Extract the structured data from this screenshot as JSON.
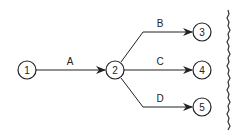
{
  "diagram": {
    "type": "activity-on-arrow network",
    "nodes": [
      {
        "id": "1",
        "label": "1"
      },
      {
        "id": "2",
        "label": "2"
      },
      {
        "id": "3",
        "label": "3"
      },
      {
        "id": "4",
        "label": "4"
      },
      {
        "id": "5",
        "label": "5"
      }
    ],
    "edges": [
      {
        "from": "1",
        "to": "2",
        "label": "A"
      },
      {
        "from": "2",
        "to": "3",
        "label": "B"
      },
      {
        "from": "2",
        "to": "4",
        "label": "C"
      },
      {
        "from": "2",
        "to": "5",
        "label": "D"
      }
    ],
    "colors": {
      "stroke": "#222222",
      "background": "#ffffff"
    }
  }
}
